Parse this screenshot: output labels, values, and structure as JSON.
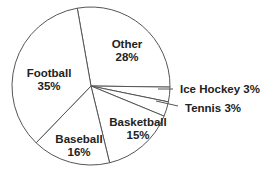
{
  "chart_data": {
    "type": "pie",
    "title": "",
    "categories": [
      "Other",
      "Ice Hockey",
      "Tennis",
      "Basketball",
      "Baseball",
      "Football"
    ],
    "values": [
      28,
      3,
      3,
      15,
      16,
      35
    ],
    "unit": "%",
    "labels": {
      "other": {
        "name": "Other",
        "pct": "28%"
      },
      "ice_hockey": {
        "name": "Ice Hockey 3%"
      },
      "tennis": {
        "name": "Tennis 3%"
      },
      "basketball": {
        "name": "Basketball",
        "pct": "15%"
      },
      "baseball": {
        "name": "Baseball",
        "pct": "16%"
      },
      "football": {
        "name": "Football",
        "pct": "35%"
      }
    },
    "start_angle_deg": -10,
    "direction": "clockwise",
    "legend": "none",
    "fill_color": "#ffffff",
    "stroke_color": "#555555"
  }
}
